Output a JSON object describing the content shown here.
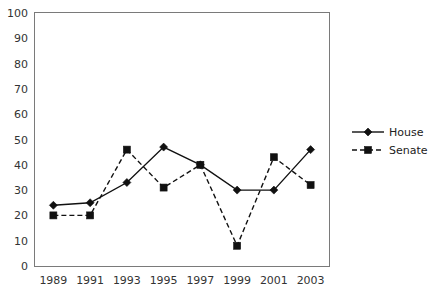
{
  "chart_data": {
    "type": "line",
    "title": "",
    "xlabel": "",
    "ylabel": "",
    "categories": [
      "1989",
      "1991",
      "1993",
      "1995",
      "1997",
      "1999",
      "2001",
      "2003"
    ],
    "x": [
      1989,
      1991,
      1993,
      1995,
      1997,
      1999,
      2001,
      2003
    ],
    "series": [
      {
        "name": "House",
        "values": [
          24,
          25,
          33,
          47,
          40,
          30,
          30,
          46
        ],
        "line_style": "solid",
        "marker": "diamond",
        "color": "#111111"
      },
      {
        "name": "Senate",
        "values": [
          20,
          20,
          46,
          31,
          40,
          8,
          43,
          32
        ],
        "line_style": "dashed",
        "marker": "square",
        "color": "#111111"
      }
    ],
    "ylim": [
      0,
      100
    ],
    "ytick_step": 10,
    "yticks": [
      0,
      10,
      20,
      30,
      40,
      50,
      60,
      70,
      80,
      90,
      100
    ],
    "ytick_labels": [
      "0",
      "10",
      "20",
      "30",
      "40",
      "50",
      "60",
      "70",
      "80",
      "90",
      "100"
    ],
    "xtick_labels": [
      "1989",
      "1991",
      "1993",
      "1995",
      "1997",
      "1999",
      "2001",
      "2003"
    ],
    "grid": true,
    "grid_axis": "y",
    "legend_position": "right",
    "legend_entries": [
      "House",
      "Senate"
    ],
    "background_color": "#ffffff",
    "grid_color": "#f0f0f0",
    "frame_color": "#7a7a7a"
  }
}
